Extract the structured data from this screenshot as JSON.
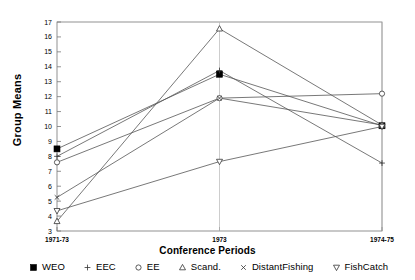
{
  "chart_data": {
    "type": "line",
    "title": "",
    "xlabel": "Conference Periods",
    "ylabel": "Group Means",
    "categories": [
      "1971-73",
      "1973",
      "1974-75"
    ],
    "ylim": [
      3,
      17
    ],
    "yticks": [
      3,
      4,
      5,
      6,
      7,
      8,
      9,
      10,
      11,
      12,
      13,
      14,
      15,
      16,
      17
    ],
    "grid": false,
    "legend_position": "bottom",
    "series": [
      {
        "name": "WEO",
        "marker": "filled-square",
        "values": [
          8.5,
          13.5,
          10.05
        ]
      },
      {
        "name": "EEC",
        "marker": "plus",
        "values": [
          8.0,
          13.75,
          7.55
        ]
      },
      {
        "name": "EE",
        "marker": "open-circle",
        "values": [
          7.6,
          11.9,
          12.2
        ]
      },
      {
        "name": "Scand.",
        "marker": "open-triangle-up",
        "values": [
          3.65,
          16.55,
          10.1
        ]
      },
      {
        "name": "DistantFishing",
        "marker": "cross",
        "values": [
          5.25,
          11.9,
          10.1
        ]
      },
      {
        "name": "FishCatch",
        "marker": "open-triangle-down",
        "values": [
          4.35,
          7.65,
          10.0
        ]
      }
    ]
  },
  "axes": {
    "y_title": "Group Means",
    "x_title": "Conference Periods",
    "y_tick_labels": [
      "17",
      "16",
      "15",
      "14",
      "13",
      "12",
      "11",
      "10",
      "9",
      "8",
      "7",
      "6",
      "5",
      "4",
      "3"
    ],
    "x_tick_labels": [
      "1971-73",
      "1973",
      "1974-75"
    ]
  },
  "legend": {
    "items": [
      {
        "label": "WEO",
        "marker": "filled-square-icon"
      },
      {
        "label": "EEC",
        "marker": "plus-icon"
      },
      {
        "label": "EE",
        "marker": "open-circle-icon"
      },
      {
        "label": "Scand.",
        "marker": "open-triangle-up-icon"
      },
      {
        "label": "DistantFishing",
        "marker": "cross-icon"
      },
      {
        "label": "FishCatch",
        "marker": "open-triangle-down-icon"
      }
    ]
  },
  "colors": {
    "line": "#555555",
    "axis": "#777777",
    "text": "#000000",
    "background": "#ffffff"
  }
}
